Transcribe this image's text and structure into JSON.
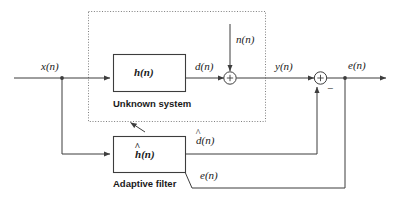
{
  "figure": {
    "type": "block-diagram",
    "stroke_color": "#3d3d3d",
    "text_color": "#1a1a1a",
    "background": "#ffffff"
  },
  "signals": {
    "input": "x(n)",
    "desired": "d(n)",
    "noise": "n(n)",
    "plant_output": "y(n)",
    "filter_output_base": "d",
    "filter_output_arg": "(n)",
    "error_top": "e(n)",
    "error_feedback": "e(n)"
  },
  "blocks": [
    {
      "name": "unknown-system",
      "symbol": "h(n)",
      "caption": "Unknown system"
    },
    {
      "name": "adaptive-filter",
      "symbol_base": "h",
      "symbol_arg": "(n)",
      "caption": "Adaptive filter"
    }
  ],
  "summers": [
    {
      "name": "summer-noise",
      "sign_in_node": "+",
      "extra_sign": ""
    },
    {
      "name": "summer-error",
      "sign_in_node": "+",
      "extra_sign": "−"
    }
  ],
  "hat_glyph": "^"
}
